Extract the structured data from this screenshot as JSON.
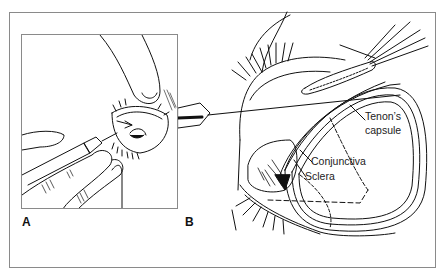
{
  "figure": {
    "panels": [
      {
        "id": "A",
        "label": "A",
        "description": "Hands holding syringe with needle entering beneath eyelid"
      },
      {
        "id": "B",
        "label": "B",
        "description": "Cross-section of eye showing sub-Tenon needle placement"
      }
    ],
    "annotations": {
      "tenons_line1": "Tenon’s",
      "tenons_line2": "capsule",
      "conjunctiva": "Conjunctiva",
      "sclera": "Sclera"
    },
    "colors": {
      "frame": "#8a8a8a",
      "ink": "#111111",
      "background": "#ffffff"
    }
  }
}
